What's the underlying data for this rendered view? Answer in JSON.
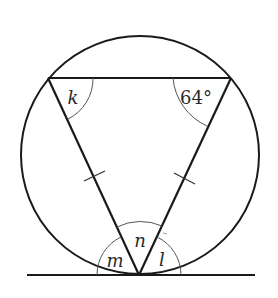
{
  "figure": {
    "colors": {
      "stroke": "#1a1a1a",
      "arc_stroke": "#555555",
      "background": "#ffffff"
    },
    "labels": {
      "top_left_angle": "k",
      "top_right_angle": "64°",
      "bottom_apex_angle": "n",
      "bottom_left_tangent_angle": "m",
      "bottom_right_tangent_angle": "l"
    },
    "marks": {
      "equal_sides": 2,
      "equal_sides_note": "Single tick marks on left and right triangle sides indicate equal lengths"
    }
  }
}
